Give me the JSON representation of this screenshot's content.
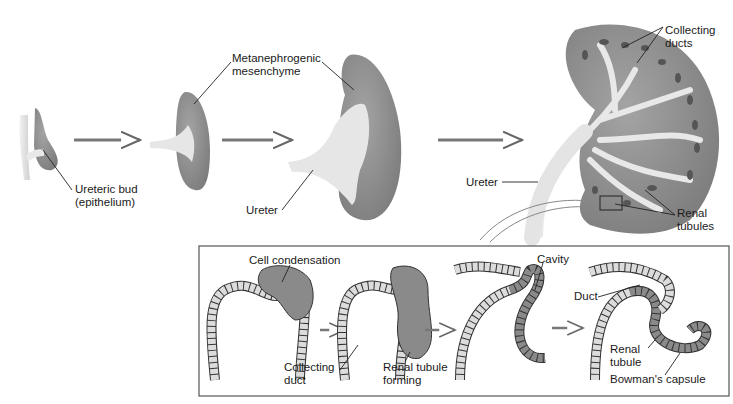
{
  "labels": {
    "ureteric_bud": [
      "Ureteric bud",
      "(epithelium)"
    ],
    "metanephrogenic": [
      "Metanephrogenic",
      "mesenchyme"
    ],
    "ureter_mid": "Ureter",
    "ureter_right": "Ureter",
    "collecting_ducts": [
      "Collecting",
      "ducts"
    ],
    "renal_tubules": [
      "Renal",
      "tubules"
    ],
    "cell_condensation": "Cell condensation",
    "collecting_duct": [
      "Collecting",
      "duct"
    ],
    "renal_tubule_forming": [
      "Renal tubule",
      "forming"
    ],
    "cavity": "Cavity",
    "duct": "Duct",
    "renal_tubule": [
      "Renal",
      "tubule"
    ],
    "bowmans_capsule": "Bowman's capsule"
  },
  "colors": {
    "mesenchyme": "#8e8e8e",
    "epithelium": "#e3e3e3",
    "tubule_cells": "#8a8a8a",
    "duct_cells": "#dcdcdc",
    "outline": "#333333"
  }
}
